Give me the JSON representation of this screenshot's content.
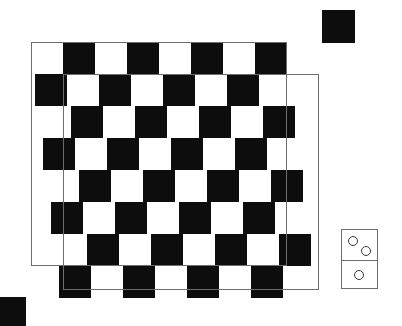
{
  "scene": {
    "title": "Checkerboard with domino and black squares",
    "width": 402,
    "height": 326,
    "background_color": "#ffffff"
  },
  "board": {
    "name": "checkerboard",
    "rows": 8,
    "columns": 8,
    "cell_size": 32,
    "dark_color": "#0d0d0d",
    "light_color": "#ffffff",
    "outline_color": "#6e6e6e",
    "origin_x": 31,
    "origin_y": 42,
    "skew_step_x": 4,
    "skew_step_y": 0,
    "pattern_start": "light",
    "grid": [
      [
        "light",
        "dark",
        "light",
        "dark",
        "light",
        "dark",
        "light",
        "dark"
      ],
      [
        "dark",
        "light",
        "dark",
        "light",
        "dark",
        "light",
        "dark",
        "light"
      ],
      [
        "light",
        "dark",
        "light",
        "dark",
        "light",
        "dark",
        "light",
        "dark"
      ],
      [
        "dark",
        "light",
        "dark",
        "light",
        "dark",
        "light",
        "dark",
        "light"
      ],
      [
        "light",
        "dark",
        "light",
        "dark",
        "light",
        "dark",
        "light",
        "dark"
      ],
      [
        "dark",
        "light",
        "dark",
        "light",
        "dark",
        "light",
        "dark",
        "light"
      ],
      [
        "light",
        "dark",
        "light",
        "dark",
        "light",
        "dark",
        "light",
        "dark"
      ],
      [
        "dark",
        "light",
        "dark",
        "light",
        "dark",
        "light",
        "dark",
        "light"
      ]
    ],
    "outlines": [
      {
        "name": "upper-board-outline",
        "x": 31,
        "y": 42,
        "width": 256,
        "height": 224
      },
      {
        "name": "lower-board-outline",
        "x": 63,
        "y": 74,
        "width": 256,
        "height": 216
      }
    ]
  },
  "squares": [
    {
      "name": "black-square-top-right",
      "x": 322,
      "y": 10,
      "width": 33,
      "height": 33,
      "color": "#0d0d0d"
    },
    {
      "name": "black-square-bottom-left",
      "x": 0,
      "y": 297,
      "width": 26,
      "height": 29,
      "color": "#0d0d0d"
    }
  ],
  "domino": {
    "name": "domino-tile",
    "x": 341,
    "y": 229,
    "width": 37,
    "height": 60,
    "border_color": "#6e6e6e",
    "face_color": "#ffffff",
    "pip_color": "#3a3a3a",
    "top_value": 2,
    "bottom_value": 1,
    "value_label": "2-1",
    "top_pips": [
      {
        "name": "pip-top-left",
        "cx": 11,
        "cy": 11,
        "r": 5
      },
      {
        "name": "pip-top-right",
        "cx": 24,
        "cy": 21,
        "r": 5
      }
    ],
    "bottom_pips": [
      {
        "name": "pip-bottom-center",
        "cx": 17,
        "cy": 45,
        "r": 5
      }
    ]
  }
}
